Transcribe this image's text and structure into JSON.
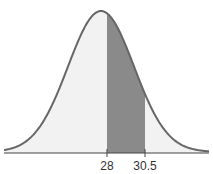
{
  "chart_data": {
    "type": "area",
    "title": "",
    "xlabel": "",
    "ylabel": "",
    "distribution": "normal",
    "shaded_region": {
      "from": 28,
      "to": 30.5
    },
    "tick_labels": [
      "28",
      "30.5"
    ],
    "grid": false,
    "legend": null
  },
  "colors": {
    "curve": "#666666",
    "fill_light": "#f2f2f2",
    "fill_shaded": "#8a8a8a",
    "axis": "#444444"
  },
  "labels": {
    "tick_28": "28",
    "tick_30_5": "30.5"
  }
}
